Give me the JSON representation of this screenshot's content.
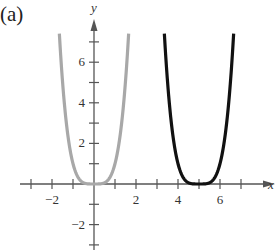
{
  "panel_label": "(a)",
  "chart_data": {
    "type": "line",
    "title": "",
    "xlabel": "x",
    "ylabel": "y",
    "xlim": [
      -3.2,
      8.5
    ],
    "ylim": [
      -3.2,
      7.8
    ],
    "grid": false,
    "legend": null,
    "x_ticks": [
      -3,
      -2,
      -1,
      0,
      1,
      2,
      3,
      4,
      5,
      6,
      7
    ],
    "x_tick_labels": [
      {
        "value": -2,
        "label": "−2"
      },
      {
        "value": 2,
        "label": "2"
      },
      {
        "value": 4,
        "label": "4"
      },
      {
        "value": 6,
        "label": "6"
      }
    ],
    "y_ticks": [
      -3,
      -2,
      -1,
      1,
      2,
      3,
      4,
      5,
      6,
      7
    ],
    "y_tick_labels": [
      {
        "value": -2,
        "label": "−2"
      },
      {
        "value": 2,
        "label": "2"
      },
      {
        "value": 4,
        "label": "4"
      },
      {
        "value": 6,
        "label": "6"
      }
    ],
    "series": [
      {
        "name": "y = x^4",
        "color": "#a8a8a8",
        "function": "x^4",
        "center": 0,
        "x": [
          -1.65,
          -1.5,
          -1.25,
          -1,
          -0.75,
          -0.5,
          0,
          0.5,
          0.75,
          1,
          1.25,
          1.5,
          1.65
        ],
        "y": [
          7.41,
          5.06,
          2.44,
          1,
          0.32,
          0.06,
          0,
          0.06,
          0.32,
          1,
          2.44,
          5.06,
          7.41
        ]
      },
      {
        "name": "y = (x-5)^4",
        "color": "#111111",
        "function": "(x-5)^4",
        "center": 5,
        "x": [
          3.35,
          3.5,
          3.75,
          4,
          4.25,
          4.5,
          5,
          5.5,
          5.75,
          6,
          6.25,
          6.5,
          6.65
        ],
        "y": [
          7.41,
          5.06,
          2.44,
          1,
          0.32,
          0.06,
          0,
          0.06,
          0.32,
          1,
          2.44,
          5.06,
          7.41
        ]
      }
    ]
  }
}
